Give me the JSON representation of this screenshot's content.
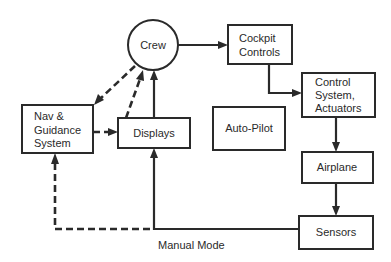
{
  "diagram": {
    "nodes": {
      "crew": {
        "label": "Crew",
        "shape": "circle"
      },
      "cockpit": {
        "line1": "Cockpit",
        "line2": "Controls"
      },
      "control": {
        "line1": "Control",
        "line2": "System,",
        "line3": "Actuators"
      },
      "nav": {
        "line1": "Nav &",
        "line2": "Guidance",
        "line3": "System"
      },
      "displays": {
        "label": "Displays"
      },
      "autopilot": {
        "label": "Auto-Pilot"
      },
      "airplane": {
        "label": "Airplane"
      },
      "sensors": {
        "label": "Sensors"
      }
    },
    "edges": [
      {
        "from": "Crew",
        "to": "Cockpit Controls",
        "style": "solid"
      },
      {
        "from": "Cockpit Controls",
        "to": "Control System, Actuators",
        "style": "solid"
      },
      {
        "from": "Control System, Actuators",
        "to": "Airplane",
        "style": "solid"
      },
      {
        "from": "Airplane",
        "to": "Sensors",
        "style": "solid"
      },
      {
        "from": "Sensors",
        "to": "Displays",
        "style": "solid"
      },
      {
        "from": "Sensors",
        "to": "Nav & Guidance System",
        "style": "dashed"
      },
      {
        "from": "Displays",
        "to": "Crew",
        "style": "solid"
      },
      {
        "from": "Displays",
        "to": "Crew",
        "style": "dashed"
      },
      {
        "from": "Crew",
        "to": "Nav & Guidance System",
        "style": "dashed"
      },
      {
        "from": "Nav & Guidance System",
        "to": "Displays",
        "style": "dashed"
      }
    ],
    "caption": "Manual Mode"
  }
}
